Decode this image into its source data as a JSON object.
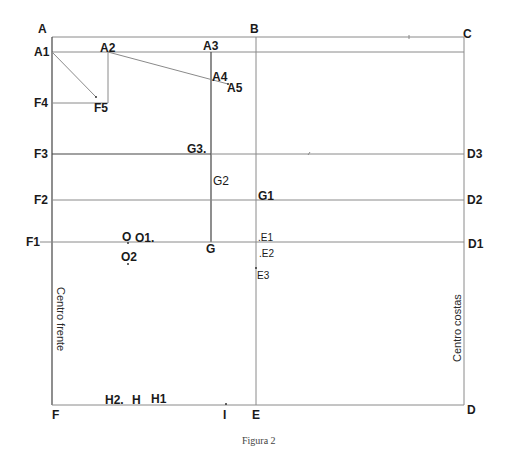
{
  "figure": {
    "caption": "Figura 2",
    "vertical_labels": {
      "left": "Centro frente",
      "right": "Centro costas"
    },
    "points": {
      "A": "A",
      "A1": "A1",
      "A2": "A2",
      "A3": "A3",
      "A4": "A4",
      "A5": "A5",
      "B": "B",
      "C": "C",
      "D": "D",
      "D1": "D1",
      "D2": "D2",
      "D3": "D3",
      "E": "E",
      "E1": ".E1",
      "E2": ".E2",
      "E3": "E3",
      "F": "F",
      "F1": "F1",
      "F2": "F2",
      "F3": "F3",
      "F4": "F4",
      "F5": "F5",
      "G": "G",
      "G1": "G1",
      "G2": "G2",
      "G3": "G3.",
      "H": "H",
      "H1": "H1",
      "H2": "H2.",
      "I": "I",
      "O": "O",
      "O1": "O1.",
      "O2": "O2"
    },
    "colors": {
      "line": "#8a8a8a",
      "dark_line": "#444444",
      "text": "#1a1a1a"
    }
  }
}
